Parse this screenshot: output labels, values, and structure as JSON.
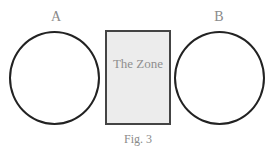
{
  "figure": {
    "caption": "Fig. 3",
    "left_circle": {
      "label": "A"
    },
    "right_circle": {
      "label": "B"
    },
    "zone": {
      "label": "The Zone",
      "fill": "#ececec"
    },
    "stroke_color": "#222222",
    "text_color": "#8a8a8a"
  }
}
